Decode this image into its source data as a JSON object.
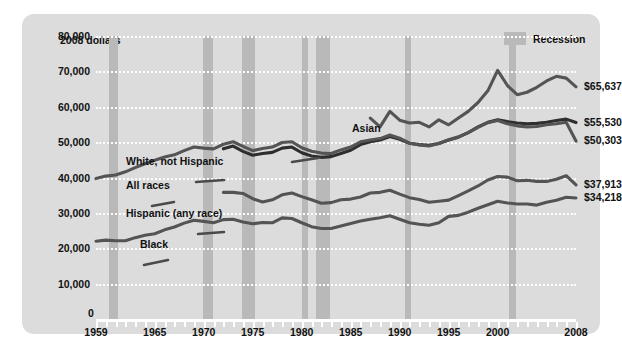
{
  "chart_data": {
    "type": "line",
    "title": "",
    "ylabel": "2008 dollars",
    "xlabel": "",
    "ylim": [
      0,
      80000
    ],
    "xlim": [
      1959,
      2008
    ],
    "yticks": [
      "0",
      "10,000",
      "20,000",
      "30,000",
      "40,000",
      "50,000",
      "60,000",
      "70,000",
      "80,000"
    ],
    "ytick_values": [
      0,
      10000,
      20000,
      30000,
      40000,
      50000,
      60000,
      70000,
      80000
    ],
    "xticks": [
      "1959",
      "1965",
      "1970",
      "1975",
      "1980",
      "1985",
      "1990",
      "1995",
      "2000",
      "2008"
    ],
    "xtick_values": [
      1959,
      1965,
      1970,
      1975,
      1980,
      1985,
      1990,
      1995,
      2000,
      2008
    ],
    "grid": true,
    "legend_position": "top-right",
    "legend": [
      {
        "label": "Recession",
        "color": "#b9b9b9",
        "kind": "band"
      }
    ],
    "recession_bands": [
      {
        "start": 1960.3,
        "end": 1961.2
      },
      {
        "start": 1969.9,
        "end": 1970.9
      },
      {
        "start": 1973.9,
        "end": 1975.2
      },
      {
        "start": 1980.0,
        "end": 1980.6
      },
      {
        "start": 1981.5,
        "end": 1982.9
      },
      {
        "start": 1990.5,
        "end": 1991.2
      },
      {
        "start": 2001.2,
        "end": 2001.9
      }
    ],
    "series": [
      {
        "name": "Asian",
        "color": "#545454",
        "end_value_label": "$65,637",
        "end_value": 65637,
        "x": [
          1987,
          1988,
          1989,
          1990,
          1991,
          1992,
          1993,
          1994,
          1995,
          1996,
          1997,
          1998,
          1999,
          2000,
          2001,
          2002,
          2003,
          2004,
          2005,
          2006,
          2007,
          2008
        ],
        "values": [
          56800,
          54300,
          58700,
          56200,
          55400,
          55600,
          54300,
          56300,
          54900,
          56800,
          58700,
          61200,
          64500,
          70300,
          66000,
          63400,
          64100,
          65500,
          67300,
          68600,
          68100,
          65637
        ]
      },
      {
        "name": "White, not Hispanic",
        "color": "#2e2e2e",
        "end_value_label": "$55,530",
        "end_value": 55530,
        "x": [
          1972,
          1973,
          1974,
          1975,
          1976,
          1977,
          1978,
          1979,
          1980,
          1981,
          1982,
          1983,
          1984,
          1985,
          1986,
          1987,
          1988,
          1989,
          1990,
          1991,
          1992,
          1993,
          1994,
          1995,
          1996,
          1997,
          1998,
          1999,
          2000,
          2001,
          2002,
          2003,
          2004,
          2005,
          2006,
          2007,
          2008
        ],
        "values": [
          48100,
          48900,
          47400,
          46300,
          46800,
          47100,
          48300,
          48600,
          47000,
          46100,
          45700,
          45900,
          46800,
          47700,
          49300,
          50100,
          50600,
          51600,
          50800,
          49700,
          49300,
          49100,
          49600,
          50600,
          51400,
          52700,
          54300,
          55600,
          56300,
          55800,
          55400,
          55200,
          55300,
          55600,
          56100,
          56500,
          55530
        ]
      },
      {
        "name": "All races",
        "color": "#545454",
        "end_value_label": "$50,303",
        "end_value": 50303,
        "x": [
          1959,
          1960,
          1961,
          1962,
          1963,
          1964,
          1965,
          1966,
          1967,
          1968,
          1969,
          1970,
          1971,
          1972,
          1973,
          1974,
          1975,
          1976,
          1977,
          1978,
          1979,
          1980,
          1981,
          1982,
          1983,
          1984,
          1985,
          1986,
          1987,
          1988,
          1989,
          1990,
          1991,
          1992,
          1993,
          1994,
          1995,
          1996,
          1997,
          1998,
          1999,
          2000,
          2001,
          2002,
          2003,
          2004,
          2005,
          2006,
          2007,
          2008
        ],
        "values": [
          39700,
          40400,
          40700,
          41600,
          42800,
          43900,
          44900,
          45800,
          46400,
          47600,
          48600,
          48300,
          48100,
          49400,
          50100,
          48800,
          47600,
          48200,
          48600,
          49900,
          50100,
          48400,
          47400,
          46900,
          46800,
          47800,
          48600,
          50100,
          50600,
          51000,
          52000,
          51100,
          49700,
          49200,
          48900,
          49600,
          50700,
          51500,
          52700,
          54200,
          55500,
          56100,
          55200,
          54600,
          54300,
          54400,
          54900,
          55200,
          55600,
          50303
        ]
      },
      {
        "name": "Hispanic (any race)",
        "color": "#545454",
        "end_value_label": "$37,913",
        "end_value": 37913,
        "x": [
          1972,
          1973,
          1974,
          1975,
          1976,
          1977,
          1978,
          1979,
          1980,
          1981,
          1982,
          1983,
          1984,
          1985,
          1986,
          1987,
          1988,
          1989,
          1990,
          1991,
          1992,
          1993,
          1994,
          1995,
          1996,
          1997,
          1998,
          1999,
          2000,
          2001,
          2002,
          2003,
          2004,
          2005,
          2006,
          2007,
          2008
        ],
        "values": [
          35800,
          35800,
          35500,
          34000,
          33100,
          33700,
          35100,
          35600,
          34600,
          33700,
          32700,
          32900,
          33700,
          33900,
          34500,
          35600,
          35800,
          36400,
          35300,
          34300,
          33800,
          33000,
          33300,
          33600,
          34900,
          36200,
          37600,
          39300,
          40300,
          40100,
          39100,
          39200,
          38900,
          38900,
          39500,
          40500,
          37913
        ]
      },
      {
        "name": "Black",
        "color": "#545454",
        "end_value_label": "$34,218",
        "end_value": 34218,
        "x": [
          1959,
          1960,
          1961,
          1962,
          1963,
          1964,
          1965,
          1966,
          1967,
          1968,
          1969,
          1970,
          1971,
          1972,
          1973,
          1974,
          1975,
          1976,
          1977,
          1978,
          1979,
          1980,
          1981,
          1982,
          1983,
          1984,
          1985,
          1986,
          1987,
          1988,
          1989,
          1990,
          1991,
          1992,
          1993,
          1994,
          1995,
          1996,
          1997,
          1998,
          1999,
          2000,
          2001,
          2002,
          2003,
          2004,
          2005,
          2006,
          2007,
          2008
        ],
        "values": [
          22000,
          22300,
          22100,
          22100,
          23000,
          23700,
          24100,
          25200,
          26000,
          27100,
          27900,
          27600,
          27200,
          28100,
          28200,
          27400,
          26900,
          27300,
          27200,
          28600,
          28400,
          27200,
          26100,
          25600,
          25600,
          26300,
          27000,
          27700,
          28200,
          28600,
          29200,
          28200,
          27200,
          26800,
          26500,
          27200,
          29000,
          29300,
          30200,
          31300,
          32300,
          33300,
          32800,
          32500,
          32500,
          32200,
          33000,
          33600,
          34400,
          34218
        ]
      }
    ],
    "series_labels": [
      {
        "text": "Asian",
        "x": 330,
        "y": 115
      },
      {
        "text": "White, not Hispanic",
        "x": 104,
        "y": 148
      },
      {
        "text": "All races",
        "x": 104,
        "y": 172
      },
      {
        "text": "Hispanic (any race)",
        "x": 104,
        "y": 200
      },
      {
        "text": "Black",
        "x": 118,
        "y": 231
      }
    ]
  }
}
